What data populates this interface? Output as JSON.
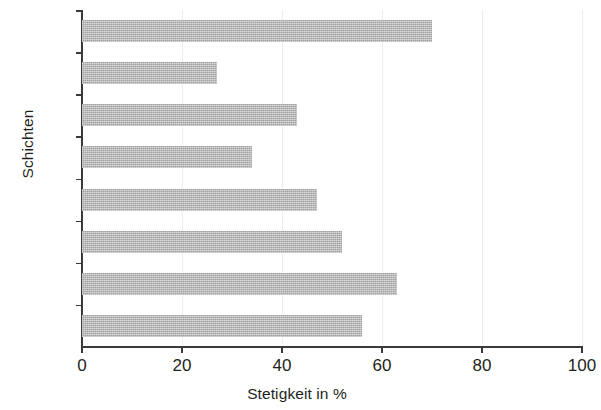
{
  "chart_data": {
    "type": "bar",
    "orientation": "horizontal",
    "title": "",
    "xlabel": "Stetigkeit in %",
    "ylabel": "Schichten",
    "categories": [
      "Ezt",
      "J-L",
      "I",
      "H",
      "G",
      "F",
      "E",
      "D"
    ],
    "values": [
      70,
      27,
      43,
      34,
      47,
      52,
      63,
      56
    ],
    "xlim": [
      0,
      100
    ],
    "xticks": [
      0,
      20,
      40,
      60,
      80,
      100
    ],
    "xtick_labels": [
      "0",
      "20",
      "40",
      "60",
      "80",
      "100"
    ],
    "grid": "vertical-light",
    "legend": "none",
    "bar_color": "#b4b4b4",
    "axis_color": "#3a3a3a",
    "gridline_color": "#ededed",
    "series": [
      {
        "name": "Stetigkeit",
        "values": [
          70,
          27,
          43,
          34,
          47,
          52,
          63,
          56
        ]
      }
    ],
    "points": [
      {
        "category": "Ezt",
        "value": 70
      },
      {
        "category": "J-L",
        "value": 27
      },
      {
        "category": "I",
        "value": 43
      },
      {
        "category": "H",
        "value": 34
      },
      {
        "category": "G",
        "value": 47
      },
      {
        "category": "F",
        "value": 52
      },
      {
        "category": "E",
        "value": 63
      },
      {
        "category": "D",
        "value": 56
      }
    ]
  }
}
